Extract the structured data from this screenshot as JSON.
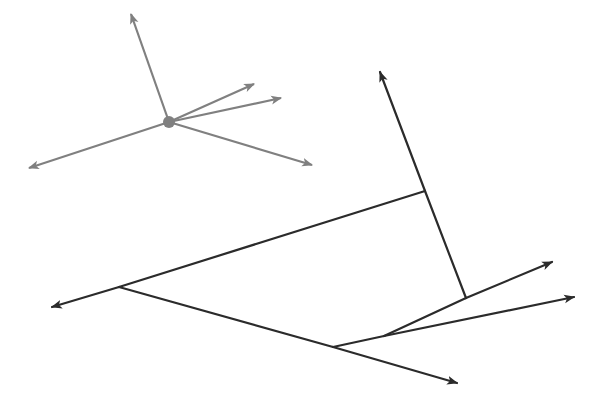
{
  "diagram": {
    "width": 603,
    "height": 407,
    "background": "#ffffff",
    "star": {
      "color": "#808080",
      "stroke_width": 2.2,
      "center": {
        "x": 169,
        "y": 122,
        "r": 6
      },
      "rays": [
        {
          "name": "ray-up",
          "to": [
            131,
            14
          ]
        },
        {
          "name": "ray-upper-right-1",
          "to": [
            254,
            84
          ]
        },
        {
          "name": "ray-upper-right-2",
          "to": [
            281,
            98
          ]
        },
        {
          "name": "ray-lower-right",
          "to": [
            312,
            165
          ]
        },
        {
          "name": "ray-left",
          "to": [
            29,
            168
          ]
        }
      ]
    },
    "tree": {
      "color": "#2b2b2b",
      "stroke_width": 2.2,
      "segments": [
        {
          "name": "left-arrow-edge",
          "from": [
            119,
            287
          ],
          "to": [
            52,
            307
          ],
          "arrow": true
        },
        {
          "name": "trunk-edge",
          "from": [
            119,
            287
          ],
          "to": [
            425,
            191
          ],
          "arrow": false
        },
        {
          "name": "vertical-lower-edge",
          "from": [
            466,
            298
          ],
          "to": [
            425,
            191
          ],
          "arrow": false
        },
        {
          "name": "top-arrow-edge",
          "from": [
            425,
            191
          ],
          "to": [
            380,
            72
          ],
          "arrow": true
        },
        {
          "name": "lower-branch-edge",
          "from": [
            119,
            287
          ],
          "to": [
            333,
            347
          ],
          "arrow": false
        },
        {
          "name": "bottom-arrow-edge",
          "from": [
            333,
            347
          ],
          "to": [
            457,
            383
          ],
          "arrow": true
        },
        {
          "name": "shared-edge",
          "from": [
            333,
            347
          ],
          "to": [
            384,
            336
          ],
          "arrow": false
        },
        {
          "name": "mid-edge",
          "from": [
            384,
            336
          ],
          "to": [
            466,
            298
          ],
          "arrow": false
        },
        {
          "name": "upper-right-arrow-edge",
          "from": [
            466,
            298
          ],
          "to": [
            552,
            262
          ],
          "arrow": true
        },
        {
          "name": "right-arrow-edge",
          "from": [
            384,
            336
          ],
          "to": [
            574,
            297
          ],
          "arrow": true
        }
      ]
    }
  }
}
